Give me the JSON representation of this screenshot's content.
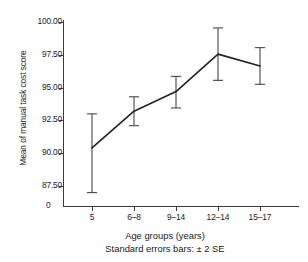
{
  "chart_data": {
    "type": "line",
    "title": "",
    "xlabel": "Age groups (years)",
    "ylabel": "Mean of manual task cost score",
    "note": "Standard errors bars: ± 2 SE",
    "categories": [
      "5",
      "6–8",
      "9–14",
      "12–14",
      "15–17"
    ],
    "values": [
      90.4,
      93.2,
      94.7,
      97.55,
      96.65
    ],
    "err_low": [
      87.0,
      92.1,
      93.45,
      95.55,
      95.25
    ],
    "err_high": [
      93.0,
      94.3,
      95.85,
      99.55,
      98.05
    ],
    "yticks": [
      "100.00",
      "97.50",
      "95.00",
      "92.50",
      "90.00",
      "87.50"
    ],
    "ytick_values": [
      100.0,
      97.5,
      95.0,
      92.5,
      90.0,
      87.5
    ],
    "ylim": [
      87.0,
      100.0
    ],
    "origin_label": "0",
    "grid": false,
    "legend": "none",
    "series": [
      {
        "name": "Mean manual task cost score",
        "values": [
          90.4,
          93.2,
          94.7,
          97.55,
          96.65
        ]
      }
    ],
    "line_color": "#222222",
    "error_bar_color": "#555555"
  }
}
